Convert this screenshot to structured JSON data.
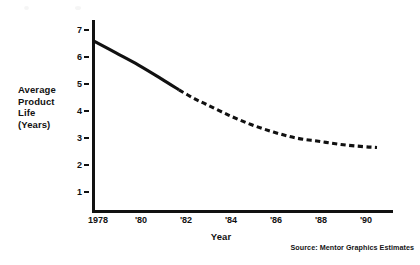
{
  "chart_data": {
    "type": "line",
    "title": "",
    "xlabel": "Year",
    "ylabel": "Average Product Life (Years)",
    "ylabel_lines": [
      "Average",
      "Product",
      "Life",
      "(Years)"
    ],
    "xlim": [
      1978,
      1991
    ],
    "ylim": [
      0,
      7.3
    ],
    "grid": false,
    "legend": null,
    "ytick_labels": [
      "7",
      "6",
      "5",
      "4",
      "3",
      "2",
      "1"
    ],
    "ytick_values": [
      7,
      6,
      5,
      4,
      3,
      2,
      1
    ],
    "xtick_labels": [
      "1978",
      "'80",
      "'82",
      "'84",
      "'86",
      "'88",
      "'90"
    ],
    "xtick_values": [
      1978,
      1980,
      1982,
      1984,
      1986,
      1988,
      1990
    ],
    "series": [
      {
        "name": "Average Product Life",
        "style": "solid",
        "segment": "actual",
        "x": [
          1978,
          1979,
          1980,
          1981,
          1981.8
        ],
        "values": [
          6.6,
          6.15,
          5.7,
          5.2,
          4.78
        ]
      },
      {
        "name": "Average Product Life (projected)",
        "style": "dashed",
        "segment": "projection",
        "x": [
          1981.8,
          1982.5,
          1983,
          1984,
          1985,
          1986,
          1987,
          1988,
          1989,
          1990,
          1990.6
        ],
        "values": [
          4.78,
          4.45,
          4.25,
          3.85,
          3.5,
          3.22,
          3.0,
          2.88,
          2.76,
          2.68,
          2.65
        ]
      }
    ],
    "annotations": [],
    "source": "Source: Mentor Graphics Estimates"
  },
  "colors": {
    "line": "#111111",
    "axis": "#111111",
    "background": "#ffffff",
    "text": "#111111"
  }
}
